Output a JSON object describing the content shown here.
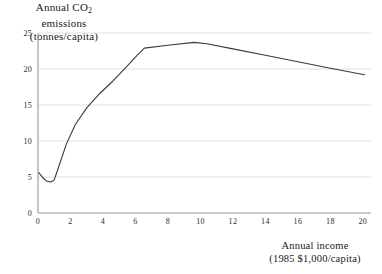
{
  "chart_data": {
    "type": "line",
    "title": "",
    "ylabel_lines": [
      "Annual CO₂",
      "emissions",
      "(tonnes/capita)"
    ],
    "xlabel_lines": [
      "Annual income",
      "(1985 $1,000/capita)"
    ],
    "ylabel": "Annual CO2 emissions (tonnes/capita)",
    "xlabel": "Annual income (1985 $1,000/capita)",
    "xlim": [
      0,
      20.5
    ],
    "ylim": [
      0,
      25
    ],
    "xticks": [
      0,
      2,
      4,
      6,
      8,
      10,
      12,
      14,
      16,
      18,
      20
    ],
    "yticks": [
      0,
      5,
      10,
      15,
      20,
      25
    ],
    "xtick_labels": [
      "0",
      "2",
      "4",
      "6",
      "8",
      "10",
      "12",
      "14",
      "16",
      "18",
      "20"
    ],
    "ytick_labels": [
      "0",
      "5",
      "10",
      "15",
      "20",
      "25"
    ],
    "grid": "horizontal",
    "legend": "none",
    "series": [
      {
        "name": "CO2 emissions vs income",
        "color": "#3a3a3a",
        "x": [
          0.05,
          0.3,
          0.55,
          0.8,
          1.0,
          1.3,
          1.75,
          2.3,
          3.0,
          3.8,
          4.6,
          5.4,
          6.1,
          6.55,
          8.0,
          9.6,
          10.4,
          12.0,
          14.0,
          16.0,
          18.0,
          20.1
        ],
        "y": [
          5.6,
          4.9,
          4.4,
          4.3,
          4.6,
          6.6,
          9.6,
          12.3,
          14.6,
          16.6,
          18.3,
          20.2,
          21.9,
          22.9,
          23.3,
          23.7,
          23.5,
          22.8,
          21.9,
          21.0,
          20.1,
          19.2
        ]
      }
    ]
  },
  "axes": {
    "plot_left_px": 38,
    "plot_right_px": 371,
    "plot_top_px": 33,
    "plot_bottom_px": 213
  },
  "colors": {
    "line": "#3a3a3a",
    "grid": "#d8d8d8",
    "axis": "#9a9a9a",
    "text": "#1a1a1a",
    "background": "#ffffff"
  }
}
